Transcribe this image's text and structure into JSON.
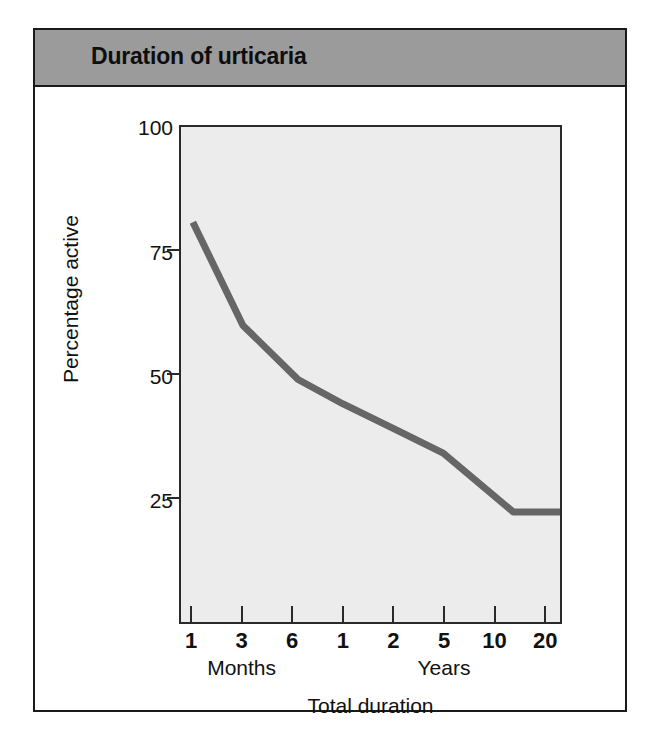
{
  "figure": {
    "title": "Duration of urticaria",
    "banner_color": "#9b9b9b",
    "frame_color": "#1a1a1a",
    "plot_background": "#ececec",
    "line_color": "#666666"
  },
  "chart_data": {
    "type": "line",
    "title": "Duration of urticaria",
    "xlabel": "Total duration",
    "ylabel": "Percentage active",
    "ylim": [
      0,
      100
    ],
    "y_ticks": [
      100,
      75,
      50,
      25
    ],
    "grid": false,
    "legend": null,
    "x_tick_labels": [
      "1",
      "3",
      "6",
      "1",
      "2",
      "5",
      "10",
      "20"
    ],
    "x_tick_units": [
      "Months",
      "Months",
      "Months",
      "Years",
      "Years",
      "Years",
      "Years",
      "Years"
    ],
    "x_group_labels": [
      {
        "label": "Months",
        "center_tick_index": 1
      },
      {
        "label": "Years",
        "center_tick_index": 5
      }
    ],
    "series": [
      {
        "name": "Percentage active",
        "points": [
          {
            "x_label": "1 month",
            "tick_index": 0,
            "value": 81
          },
          {
            "x_label": "3 months",
            "tick_index": 1.0,
            "value": 60
          },
          {
            "x_label": "6 months",
            "tick_index": 2.1,
            "value": 49
          },
          {
            "x_label": "1 year",
            "tick_index": 3.0,
            "value": 44
          },
          {
            "x_label": "2 years",
            "tick_index": 4.0,
            "value": 39
          },
          {
            "x_label": "5 years",
            "tick_index": 5.0,
            "value": 34
          },
          {
            "x_label": "9 years",
            "tick_index": 6.4,
            "value": 22
          },
          {
            "x_label": "20 years",
            "tick_index": 7.4,
            "value": 22
          }
        ]
      }
    ]
  },
  "axes": {
    "y_tick_labels": [
      "100",
      "75",
      "50",
      "25"
    ],
    "x_tick_labels": [
      "1",
      "3",
      "6",
      "1",
      "2",
      "5",
      "10",
      "20"
    ],
    "x_group_months": "Months",
    "x_group_years": "Years",
    "y_title": "Percentage active",
    "x_title": "Total duration"
  }
}
